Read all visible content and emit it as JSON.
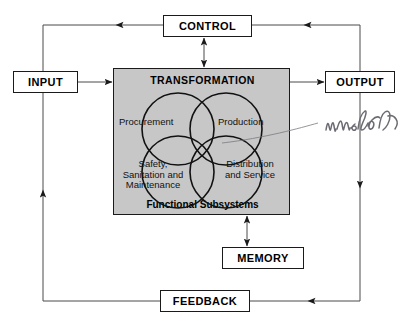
{
  "diagram": {
    "nodes": {
      "control": "CONTROL",
      "input": "INPUT",
      "output": "OUTPUT",
      "memory": "MEMORY",
      "feedback": "FEEDBACK",
      "transformation": "TRANSFORMATION",
      "subsystems_caption": "Functional Subsystems"
    },
    "subsystems": [
      {
        "key": "procurement",
        "label": "Procurement"
      },
      {
        "key": "production",
        "label": "Production"
      },
      {
        "key": "safety",
        "label": "Safety,\nSanitation and\nMaintenance",
        "line1": "Safety,",
        "line2": "Sanitation and",
        "line3": "Maintenance"
      },
      {
        "key": "distribution",
        "label": "Distribution\nand Service",
        "line1": "Distribution",
        "line2": "and Service"
      }
    ],
    "annotation": {
      "text": "interaction",
      "style": "handwritten"
    },
    "colors": {
      "transformation_fill": "#c7c7c7",
      "box_fill": "#ffffff",
      "stroke": "#1a1a1a",
      "annotation_ink": "#6b6b73",
      "page_background": "#ffffff"
    },
    "flows": [
      {
        "from": "input",
        "to": "transformation",
        "direction": "one-way"
      },
      {
        "from": "transformation",
        "to": "output",
        "direction": "one-way"
      },
      {
        "from": "control",
        "to": "transformation",
        "direction": "two-way"
      },
      {
        "from": "transformation",
        "to": "memory",
        "direction": "two-way"
      },
      {
        "from": "output",
        "to": "control",
        "direction": "one-way"
      },
      {
        "from": "control",
        "to": "input",
        "direction": "one-way"
      },
      {
        "from": "output",
        "to": "feedback",
        "direction": "one-way"
      },
      {
        "from": "feedback",
        "to": "input",
        "direction": "one-way"
      }
    ]
  }
}
